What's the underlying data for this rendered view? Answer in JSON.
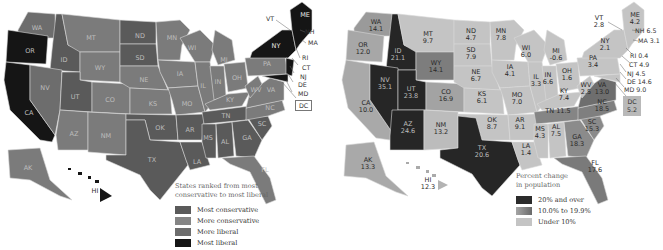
{
  "left_map": {
    "legend": {
      "title_line1": "States ranked from most",
      "title_line2": "conservative to most liberal",
      "items": [
        {
          "label": "Most conservative",
          "color": "#5a5a5a"
        },
        {
          "label": "More conservative",
          "color": "#7b7b7b"
        },
        {
          "label": "More liberal",
          "color": "#6d6d6d"
        },
        {
          "label": "Most liberal",
          "color": "#151515"
        }
      ]
    },
    "states": {
      "WA": "WA",
      "OR": "OR",
      "CA": "CA",
      "ID": "ID",
      "NV": "NV",
      "MT": "MT",
      "WY": "WY",
      "UT": "UT",
      "CO": "CO",
      "AZ": "AZ",
      "NM": "NM",
      "ND": "ND",
      "SD": "SD",
      "NE": "NE",
      "KS": "KS",
      "OK": "OK",
      "TX": "TX",
      "MN": "MN",
      "IA": "IA",
      "MO": "MO",
      "AR": "AR",
      "LA": "LA",
      "WI": "WI",
      "IL": "IL",
      "MI": "MI",
      "IN": "IN",
      "OH": "OH",
      "KY": "KY",
      "TN": "TN",
      "MS": "MS",
      "AL": "AL",
      "GA": "GA",
      "FL": "FL",
      "SC": "SC",
      "NC": "NC",
      "VA": "VA",
      "WV": "WV",
      "PA": "PA",
      "NY": "NY",
      "ME": "ME",
      "AK": "AK",
      "HI": "HI"
    },
    "callouts": [
      "VT",
      "NH",
      "MA",
      "RI",
      "CT",
      "NJ",
      "DE",
      "MD",
      "DC"
    ]
  },
  "right_map": {
    "legend": {
      "title_line1": "Percent change",
      "title_line2": "in population",
      "items": [
        {
          "label": "20% and over",
          "color": "#2b2b2b"
        },
        {
          "label": "10.0% to 19.9%",
          "color": "#858585"
        },
        {
          "label": "Under 10%",
          "color": "#c4c4c4"
        }
      ]
    },
    "states": {
      "WA": {
        "abbr": "WA",
        "value": "14.1"
      },
      "OR": {
        "abbr": "OR",
        "value": "12.0"
      },
      "CA": {
        "abbr": "CA",
        "value": "10.0"
      },
      "ID": {
        "abbr": "ID",
        "value": "21.1"
      },
      "NV": {
        "abbr": "NV",
        "value": "35.1"
      },
      "MT": {
        "abbr": "MT",
        "value": "9.7"
      },
      "WY": {
        "abbr": "WY",
        "value": "14.1"
      },
      "UT": {
        "abbr": "UT",
        "value": "23.8"
      },
      "CO": {
        "abbr": "CO",
        "value": "16.9"
      },
      "AZ": {
        "abbr": "AZ",
        "value": "24.6"
      },
      "NM": {
        "abbr": "NM",
        "value": "13.2"
      },
      "ND": {
        "abbr": "ND",
        "value": "4.7"
      },
      "SD": {
        "abbr": "SD",
        "value": "7.9"
      },
      "NE": {
        "abbr": "NE",
        "value": "6.7"
      },
      "KS": {
        "abbr": "KS",
        "value": "6.1"
      },
      "OK": {
        "abbr": "OK",
        "value": "8.7"
      },
      "TX": {
        "abbr": "TX",
        "value": "20.6"
      },
      "MN": {
        "abbr": "MN",
        "value": "7.8"
      },
      "IA": {
        "abbr": "IA",
        "value": "4.1"
      },
      "MO": {
        "abbr": "MO",
        "value": "7.0"
      },
      "AR": {
        "abbr": "AR",
        "value": "9.1"
      },
      "LA": {
        "abbr": "LA",
        "value": "1.4"
      },
      "WI": {
        "abbr": "WI",
        "value": "6.0"
      },
      "IL": {
        "abbr": "IL",
        "value": "3.3"
      },
      "MI": {
        "abbr": "MI",
        "value": "-0.6"
      },
      "IN": {
        "abbr": "IN",
        "value": "6.6"
      },
      "OH": {
        "abbr": "OH",
        "value": "1.6"
      },
      "KY": {
        "abbr": "KY",
        "value": "7.4"
      },
      "TN": {
        "abbr": "TN",
        "value": "11.5"
      },
      "MS": {
        "abbr": "MS",
        "value": "4.3"
      },
      "AL": {
        "abbr": "AL",
        "value": "7.5"
      },
      "GA": {
        "abbr": "GA",
        "value": "18.3"
      },
      "FL": {
        "abbr": "FL",
        "value": "17.6"
      },
      "SC": {
        "abbr": "SC",
        "value": "15.3"
      },
      "NC": {
        "abbr": "NC",
        "value": "18.5"
      },
      "VA": {
        "abbr": "VA",
        "value": "13.0"
      },
      "WV": {
        "abbr": "WV",
        "value": "2.5"
      },
      "PA": {
        "abbr": "PA",
        "value": "3.4"
      },
      "NY": {
        "abbr": "NY",
        "value": "2.1"
      },
      "ME": {
        "abbr": "ME",
        "value": "4.2"
      },
      "VT": {
        "abbr": "VT",
        "value": "2.8"
      },
      "AK": {
        "abbr": "AK",
        "value": "13.3"
      },
      "HI": {
        "abbr": "HI",
        "value": "12.3"
      }
    },
    "callouts": {
      "NH": "NH 6.5",
      "MA": "MA 3.1",
      "RI": "RI 0.4",
      "CT": "CT 4.9",
      "NJ": "NJ 4.5",
      "DE": "DE 14.6",
      "MD": "MD 9.0",
      "DC_abbr": "DC",
      "DC_value": "5.2"
    }
  }
}
